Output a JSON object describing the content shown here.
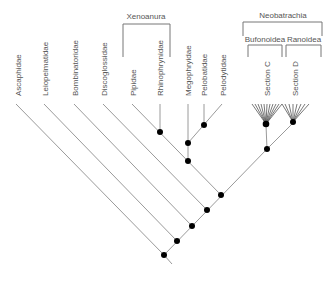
{
  "diagram": {
    "type": "phylogenetic-tree",
    "taxa": [
      {
        "label": "Ascaphidae"
      },
      {
        "label": "Leiopelmatidae"
      },
      {
        "label": "Bombinatoridae"
      },
      {
        "label": "Discoglossidae"
      },
      {
        "label": "Pipidae"
      },
      {
        "label": "Rhinophrynidae"
      },
      {
        "label": "Megophryidae"
      },
      {
        "label": "Pelobatidae"
      },
      {
        "label": "Pelodytidae"
      },
      {
        "label": "Section C"
      },
      {
        "label": "Section D"
      }
    ],
    "groups": {
      "xenoanura": "Xenoanura",
      "neobatrachia": "Neobatrachia",
      "bufonoidea": "Bufonoidea",
      "ranoidea": "Ranoidea"
    },
    "colors": {
      "branch": "#9a9a9a",
      "node": "#000000",
      "text": "#555555"
    }
  }
}
